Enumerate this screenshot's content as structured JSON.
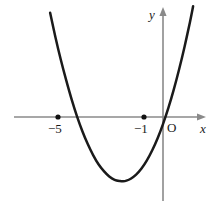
{
  "chart_data": {
    "type": "line",
    "title": "",
    "subtitle": "",
    "xlabel": "x",
    "ylabel": "y",
    "origin_label": "O",
    "grid": false,
    "legend": null,
    "xlim": [
      -7.6,
      2.1
    ],
    "ylim": [
      -1.6,
      4.9
    ],
    "axes": {
      "x_axis_color": "#8a8a8a",
      "y_axis_color": "#8a8a8a",
      "arrowheads": [
        "x-positive",
        "y-positive"
      ]
    },
    "curve": {
      "name": "parabola",
      "color": "#1a1a1a",
      "vertex": [
        -1.86,
        -1.17
      ],
      "roots": [
        -3.95,
        -0.23
      ],
      "opens": "up",
      "points": [
        [
          -5.25,
          4.85
        ],
        [
          -5.0,
          3.7
        ],
        [
          -4.75,
          2.65
        ],
        [
          -4.5,
          1.7
        ],
        [
          -4.25,
          0.82
        ],
        [
          -4.0,
          0.03
        ],
        [
          -3.75,
          -0.66
        ],
        [
          -3.5,
          -1.26
        ],
        [
          -3.25,
          -1.77
        ],
        [
          -3.0,
          -2.2
        ],
        [
          -2.75,
          -2.52
        ],
        [
          -2.5,
          -2.77
        ],
        [
          -2.25,
          -2.92
        ],
        [
          -2.0,
          -2.98
        ],
        [
          -1.86,
          -2.99
        ],
        [
          -1.7,
          -2.96
        ],
        [
          -1.5,
          -2.87
        ],
        [
          -1.25,
          -2.68
        ],
        [
          -1.0,
          -2.4
        ],
        [
          -0.75,
          -2.02
        ],
        [
          -0.5,
          -1.55
        ],
        [
          -0.25,
          -0.99
        ],
        [
          0.0,
          -0.33
        ],
        [
          0.25,
          0.42
        ],
        [
          0.5,
          1.27
        ],
        [
          0.75,
          2.22
        ],
        [
          1.0,
          3.26
        ],
        [
          1.25,
          4.4
        ],
        [
          1.4,
          5.15
        ]
      ]
    },
    "marked_points": [
      {
        "label": "−5",
        "x": -5,
        "y": 0,
        "on_axis": "x"
      },
      {
        "label": "−1",
        "x": -1,
        "y": 0,
        "on_axis": "x"
      }
    ],
    "tick_labels": {
      "x": [
        "−5",
        "−1"
      ],
      "y": []
    }
  }
}
